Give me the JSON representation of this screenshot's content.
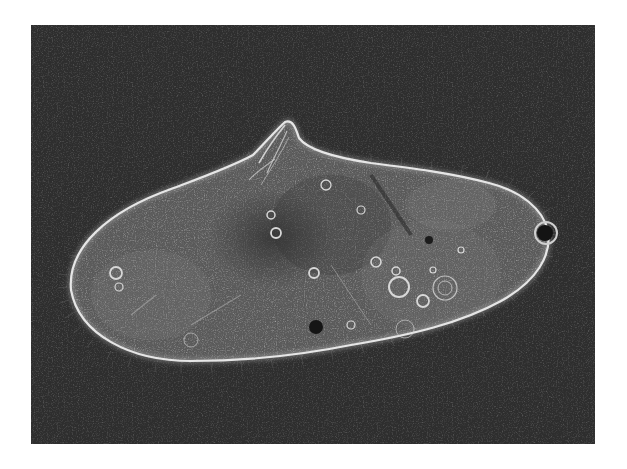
{
  "image": {
    "subject": "ciliate protist (phase-contrast micrograph)",
    "background_color": "#2e2e2e",
    "page_color": "#ffffff",
    "frame": {
      "x": 31,
      "y": 25,
      "width": 564,
      "height": 419
    },
    "features": [
      {
        "name": "cell-body",
        "description": "elongated oval cell with bright halo outline"
      },
      {
        "name": "oral-peak",
        "description": "pointed oral region projecting from top edge"
      },
      {
        "name": "contractile-vacuole",
        "description": "small dark vacuole with bright ring at right end"
      },
      {
        "name": "food-vacuoles",
        "description": "bright ring-shaped inclusions in cytoplasm"
      },
      {
        "name": "dark-granule",
        "description": "dark inclusion near lower middle"
      },
      {
        "name": "cilia",
        "description": "fine hair-like cilia fringing the cell outline"
      }
    ],
    "colors": {
      "outline": "#e6e6e6",
      "cytoplasm": "#5a5a5a",
      "cytoplasm_dark": "#3c3c3c",
      "inclusion": "#d8d8d8"
    }
  }
}
